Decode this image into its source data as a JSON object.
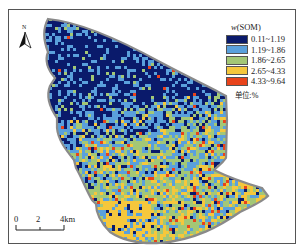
{
  "map": {
    "north_arrow": {
      "label": "N",
      "icon": "north-arrow-icon"
    },
    "legend": {
      "title_var": "w",
      "title_text": "(SOM)",
      "classes": [
        {
          "range": "0.11~1.19",
          "color": "#0a1a6b"
        },
        {
          "range": "1.19~1.86",
          "color": "#5aa0dc"
        },
        {
          "range": "1.86~2.65",
          "color": "#a3c776"
        },
        {
          "range": "2.65~4.33",
          "color": "#f5c73c"
        },
        {
          "range": "4.33~9.64",
          "color": "#e8431b"
        }
      ],
      "unit": "单位:%"
    },
    "scale_bar": {
      "labels": [
        "0",
        "2",
        "4km"
      ]
    },
    "boundary_color": "#8a8a8a"
  }
}
